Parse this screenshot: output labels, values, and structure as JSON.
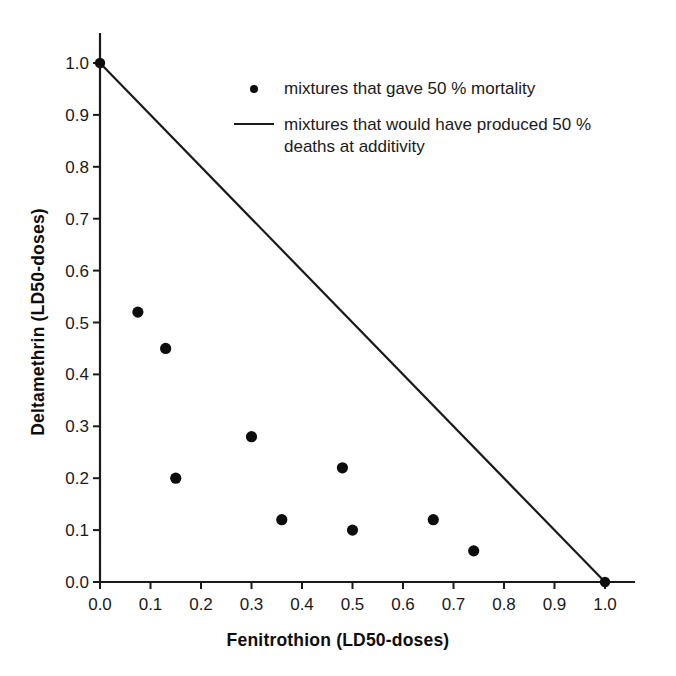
{
  "chart_data": {
    "type": "scatter",
    "title": "",
    "xlabel": "Fenitrothion (LD50-doses)",
    "ylabel": "Deltamethrin (LD50-doses)",
    "xlim": [
      0.0,
      1.0
    ],
    "ylim": [
      0.0,
      1.0
    ],
    "grid": false,
    "legend_position": "upper-right-inside",
    "xticks": [
      "0.0",
      "0.1",
      "0.2",
      "0.3",
      "0.4",
      "0.5",
      "0.6",
      "0.7",
      "0.8",
      "0.9",
      "1.0"
    ],
    "yticks": [
      "0.0",
      "0.1",
      "0.2",
      "0.3",
      "0.4",
      "0.5",
      "0.6",
      "0.7",
      "0.8",
      "0.9",
      "1.0"
    ],
    "xtick_values": [
      0.0,
      0.1,
      0.2,
      0.3,
      0.4,
      0.5,
      0.6,
      0.7,
      0.8,
      0.9,
      1.0
    ],
    "ytick_values": [
      0.0,
      0.1,
      0.2,
      0.3,
      0.4,
      0.5,
      0.6,
      0.7,
      0.8,
      0.9,
      1.0
    ],
    "series": [
      {
        "name": "mixtures that gave 50 % mortality",
        "type": "scatter",
        "marker": "filled-circle",
        "color": "#0d0d0d",
        "points": [
          {
            "x": 0.075,
            "y": 0.52
          },
          {
            "x": 0.13,
            "y": 0.45
          },
          {
            "x": 0.15,
            "y": 0.2
          },
          {
            "x": 0.3,
            "y": 0.28
          },
          {
            "x": 0.36,
            "y": 0.12
          },
          {
            "x": 0.48,
            "y": 0.22
          },
          {
            "x": 0.5,
            "y": 0.1
          },
          {
            "x": 0.66,
            "y": 0.12
          },
          {
            "x": 0.74,
            "y": 0.06
          }
        ]
      },
      {
        "name": "mixtures that would have produced 50 % deaths at additivity",
        "type": "line",
        "color": "#1a1a1a",
        "points": [
          {
            "x": 0.0,
            "y": 1.0
          },
          {
            "x": 1.0,
            "y": 0.0
          }
        ],
        "endpoint_markers": true
      }
    ]
  },
  "legend": {
    "entries": [
      {
        "marker": "dot",
        "label": "mixtures that gave 50 % mortality"
      },
      {
        "marker": "line",
        "label": "mixtures that would have produced 50 %\ndeaths at additivity"
      }
    ]
  },
  "axes": {
    "x_title": "Fenitrothion (LD50-doses)",
    "y_title": "Deltamethrin (LD50-doses)"
  },
  "colors": {
    "ink": "#1a1a1a",
    "marker": "#0d0d0d",
    "background": "#ffffff"
  }
}
